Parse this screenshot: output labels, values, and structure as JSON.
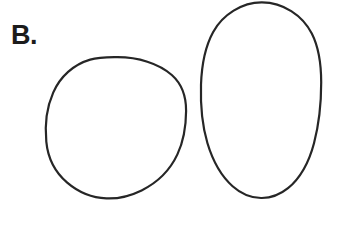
{
  "figure": {
    "panel_label": "B.",
    "background_color": "#ffffff",
    "stroke_color": "#262626",
    "stroke_width": 2.2,
    "width": 340,
    "height": 230,
    "shapes": [
      {
        "name": "circle-outline",
        "kind": "circle",
        "cx": 116,
        "cy": 128,
        "rx": 70,
        "ry": 71,
        "fill": "none",
        "stroke_color": "#262626",
        "stroke_width": 2.2,
        "bounds": {
          "left": 46,
          "top": 57,
          "right": 186,
          "bottom": 199
        }
      },
      {
        "name": "ellipse-outline",
        "kind": "ellipse",
        "cx": 261,
        "cy": 100,
        "rx": 60,
        "ry": 98,
        "fill": "none",
        "stroke_color": "#262626",
        "stroke_width": 2.2,
        "bounds": {
          "left": 201,
          "top": 2,
          "right": 321,
          "bottom": 198
        }
      }
    ]
  }
}
